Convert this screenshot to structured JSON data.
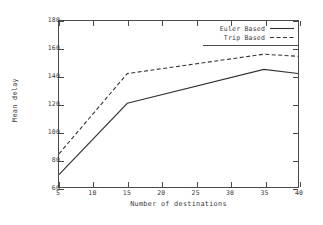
{
  "chart_data": {
    "type": "line",
    "title": "",
    "xlabel": "Number of destinations",
    "ylabel": "Mean delay",
    "xlim": [
      5,
      40
    ],
    "ylim": [
      60,
      180
    ],
    "xticks": [
      5,
      10,
      15,
      20,
      25,
      30,
      35,
      40
    ],
    "yticks": [
      60,
      80,
      100,
      120,
      140,
      160,
      180
    ],
    "grid": false,
    "legend_position": "top-right",
    "x": [
      5,
      15,
      35,
      40
    ],
    "series": [
      {
        "name": "Euler Based",
        "style": "solid",
        "color": "#333333",
        "values": [
          69,
          120.5,
          145,
          142
        ]
      },
      {
        "name": "Trip Based",
        "style": "dashed",
        "color": "#333333",
        "values": [
          84,
          142,
          156,
          154.5
        ]
      }
    ]
  },
  "axis": {
    "x_tick_labels": [
      "5",
      "10",
      "15",
      "20",
      "25",
      "30",
      "35",
      "40"
    ],
    "y_tick_labels": [
      "60",
      "80",
      "100",
      "120",
      "140",
      "160",
      "180"
    ],
    "x_title": "Number of destinations",
    "y_title": "Mean delay"
  },
  "legend": {
    "entries": [
      {
        "label": "Euler Based",
        "dash": "none"
      },
      {
        "label": "Trip Based",
        "dash": "3,2"
      }
    ]
  }
}
